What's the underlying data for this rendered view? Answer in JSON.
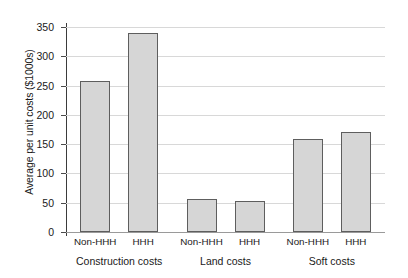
{
  "chart_data": {
    "type": "bar",
    "title": "",
    "subtitle": "",
    "xlabel": "",
    "ylabel": "Average per unit costs ($1000s)",
    "ylim": [
      0,
      350
    ],
    "ytick_values": [
      0,
      50,
      100,
      150,
      200,
      250,
      300,
      350
    ],
    "ytick_labels": [
      "0",
      "50",
      "100",
      "150",
      "200",
      "250",
      "300",
      "350"
    ],
    "grid": true,
    "legend": false,
    "legend_position": "none",
    "categories": [
      "Construction costs",
      "Land costs",
      "Soft costs"
    ],
    "subcategories": [
      "Non-HHH",
      "HHH"
    ],
    "series": [
      {
        "name": "Non-HHH",
        "values": [
          258,
          57,
          158
        ]
      },
      {
        "name": "HHH",
        "values": [
          340,
          53,
          171
        ]
      }
    ],
    "bars": [
      {
        "group": "Construction costs",
        "subcategory": "Non-HHH",
        "value": 258
      },
      {
        "group": "Construction costs",
        "subcategory": "HHH",
        "value": 340
      },
      {
        "group": "Land costs",
        "subcategory": "Non-HHH",
        "value": 57
      },
      {
        "group": "Land costs",
        "subcategory": "HHH",
        "value": 53
      },
      {
        "group": "Soft costs",
        "subcategory": "Non-HHH",
        "value": 158
      },
      {
        "group": "Soft costs",
        "subcategory": "HHH",
        "value": 171
      }
    ],
    "colors": {
      "bar_fill": "#d6d6d6",
      "bar_edge": "#5e5e5e",
      "gridline": "#d8d8d8",
      "axis": "#3b3b3b",
      "text": "#1a1a1a",
      "background": "#ffffff"
    }
  }
}
